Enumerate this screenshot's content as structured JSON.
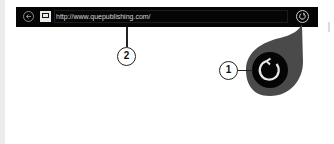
{
  "browser_bar": {
    "back_icon": "back-arrow-icon",
    "page_icon": "page-icon",
    "url": "http://www.quepublishing.com/",
    "refresh_icon": "refresh-icon"
  },
  "callouts": [
    {
      "number": "1",
      "target": "magnified-refresh-button"
    },
    {
      "number": "2",
      "target": "address-bar"
    }
  ],
  "colors": {
    "bar_background": "#050505",
    "magnifier_outer": "#4a4a4a",
    "magnifier_inner": "#050505",
    "icon_stroke": "#e0e0e0"
  }
}
